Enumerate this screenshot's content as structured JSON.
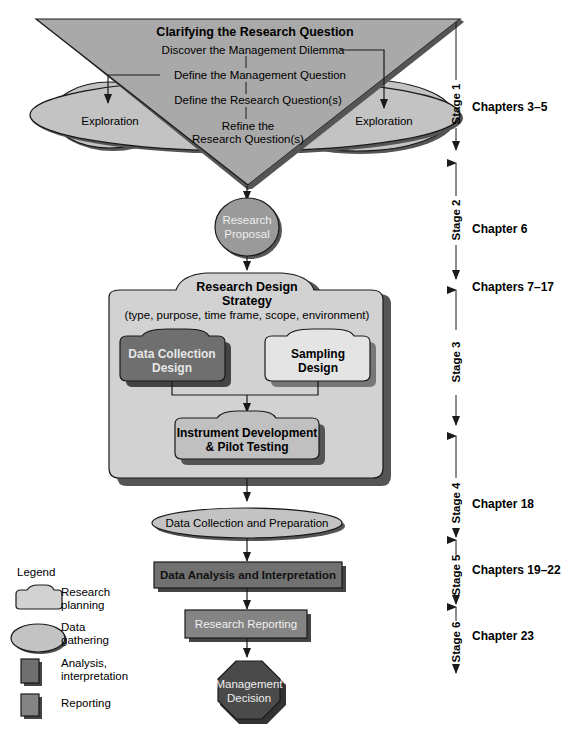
{
  "colors": {
    "triangle": "#a9a9a9",
    "ellipse_light": "#c3c3c3",
    "proposal": "#9a9a9a",
    "design_box": "#d2d2d2",
    "data_collection_design": "#6f6f6f",
    "sampling_design": "#e4e4e4",
    "instrument": "#c0c0c0",
    "analysis": "#717171",
    "reporting": "#848484",
    "decision": "#4a4a4a",
    "stroke": "#1a1a1a",
    "shadow": "#555555"
  },
  "clarify": {
    "title": "Clarifying the Research Question",
    "step1": "Discover the Management Dilemma",
    "step2": "Define the Management Question",
    "step3": "Define the Research Question(s)",
    "step4a": "Refine the",
    "step4b": "Research Question(s)",
    "exploration_left": "Exploration",
    "exploration_right": "Exploration"
  },
  "proposal": {
    "line1": "Research",
    "line2": "Proposal"
  },
  "design": {
    "title1": "Research Design",
    "title2": "Strategy",
    "subtitle": "(type, purpose, time frame, scope, environment)",
    "data_collection": {
      "line1": "Data Collection",
      "line2": "Design"
    },
    "sampling": {
      "line1": "Sampling",
      "line2": "Design"
    },
    "instrument": {
      "line1": "Instrument Development",
      "line2": "& Pilot Testing"
    }
  },
  "data_collection_prep": "Data Collection and Preparation",
  "analysis": "Data Analysis and Interpretation",
  "reporting": "Research Reporting",
  "decision": {
    "line1": "Management",
    "line2": "Decision"
  },
  "stages": [
    {
      "label": "Stage 1",
      "chapters": "Chapters 3–5"
    },
    {
      "label": "Stage 2",
      "chapters": "Chapter 6"
    },
    {
      "label": "Stage 3",
      "chapters": "Chapters 7–17"
    },
    {
      "label": "Stage 4",
      "chapters": "Chapter 18"
    },
    {
      "label": "Stage 5",
      "chapters": "Chapters 19–22"
    },
    {
      "label": "Stage 6",
      "chapters": "Chapter 23"
    }
  ],
  "legend": {
    "title": "Legend",
    "items": [
      {
        "line1": "Research",
        "line2": "planning"
      },
      {
        "line1": "Data",
        "line2": "gathering"
      },
      {
        "line1": "Analysis,",
        "line2": "interpretation"
      },
      {
        "line1": "Reporting",
        "line2": ""
      }
    ]
  }
}
